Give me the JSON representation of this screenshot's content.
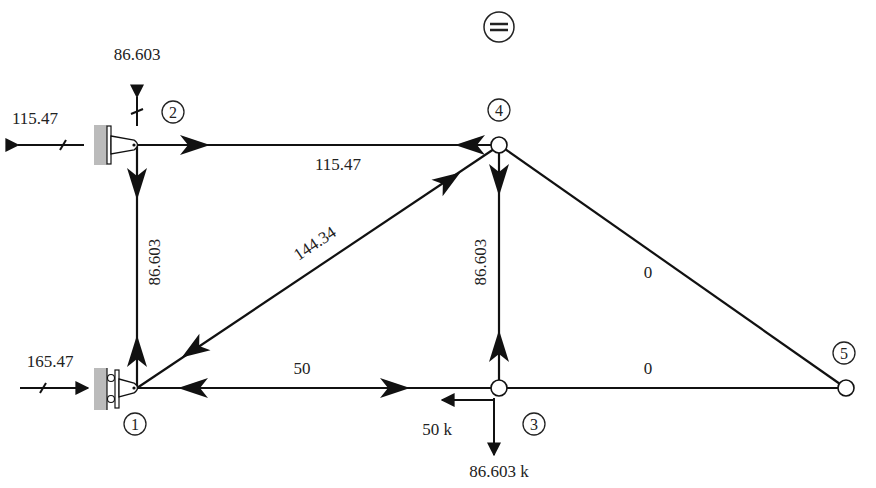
{
  "diagram": {
    "type": "truss-free-body-diagram",
    "symbol_top": "=",
    "nodes": [
      {
        "id": "1",
        "label": "1",
        "x": 137,
        "y": 388,
        "support": "roller"
      },
      {
        "id": "2",
        "label": "2",
        "x": 137,
        "y": 145,
        "support": "pin"
      },
      {
        "id": "3",
        "label": "3",
        "x": 499,
        "y": 388
      },
      {
        "id": "4",
        "label": "4",
        "x": 499,
        "y": 145
      },
      {
        "id": "5",
        "label": "5",
        "x": 846,
        "y": 388
      }
    ],
    "members": [
      {
        "from": "2",
        "to": "4",
        "force": "115.47"
      },
      {
        "from": "2",
        "to": "1",
        "force": "86.603"
      },
      {
        "from": "1",
        "to": "4",
        "force": "144.34"
      },
      {
        "from": "4",
        "to": "3",
        "force": "86.603"
      },
      {
        "from": "4",
        "to": "5",
        "force": "0"
      },
      {
        "from": "1",
        "to": "3",
        "force": "50"
      },
      {
        "from": "3",
        "to": "5",
        "force": "0"
      }
    ],
    "reactions": [
      {
        "node": "2",
        "direction": "up",
        "value": "86.603"
      },
      {
        "node": "2",
        "direction": "left",
        "value": "115.47"
      },
      {
        "node": "1",
        "direction": "right",
        "value": "165.47"
      }
    ],
    "loads": [
      {
        "node": "3",
        "direction": "left",
        "value": "50 k"
      },
      {
        "node": "3",
        "direction": "down",
        "value": "86.603 k"
      }
    ]
  }
}
